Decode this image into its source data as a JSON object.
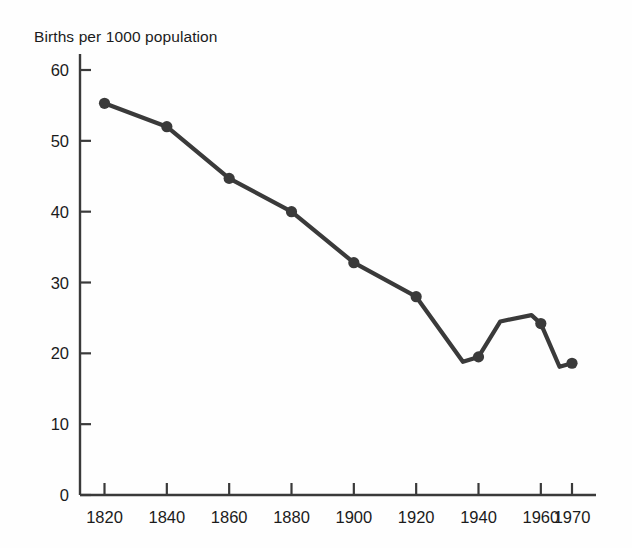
{
  "chart_data": {
    "type": "line",
    "title": "Births per 1000 population",
    "xlabel": "",
    "ylabel": "",
    "xlim": [
      1813,
      1975
    ],
    "ylim": [
      0,
      62
    ],
    "grid": false,
    "legend": "none",
    "line_color": "#3a3a3a",
    "marker_color": "#3a3a3a",
    "background_color": "#fefefe",
    "axis_color": "#3a3a3a",
    "x_ticks": [
      1820,
      1840,
      1860,
      1880,
      1900,
      1920,
      1940,
      1960,
      1970
    ],
    "x_tick_labels": [
      "1820",
      "1840",
      "1860",
      "1880",
      "1900",
      "1920",
      "1940",
      "1960",
      "1970"
    ],
    "y_ticks": [
      0,
      10,
      20,
      30,
      40,
      50,
      60
    ],
    "y_tick_labels": [
      "0",
      "10",
      "20",
      "30",
      "40",
      "50",
      "60"
    ],
    "series": [
      {
        "name": "Births per 1000 population",
        "x": [
          1820,
          1840,
          1860,
          1880,
          1900,
          1920,
          1935,
          1940,
          1947,
          1957,
          1960,
          1966,
          1970
        ],
        "values": [
          55.3,
          52.0,
          44.7,
          40.0,
          32.8,
          28.0,
          18.8,
          19.5,
          24.5,
          25.4,
          24.2,
          18.1,
          18.6
        ],
        "marked_points": [
          1820,
          1840,
          1860,
          1880,
          1900,
          1920,
          1940,
          1960,
          1970
        ],
        "marker": "circle",
        "marker_size": 7
      }
    ]
  },
  "figure": {
    "title_text": "Births per 1000 population"
  }
}
